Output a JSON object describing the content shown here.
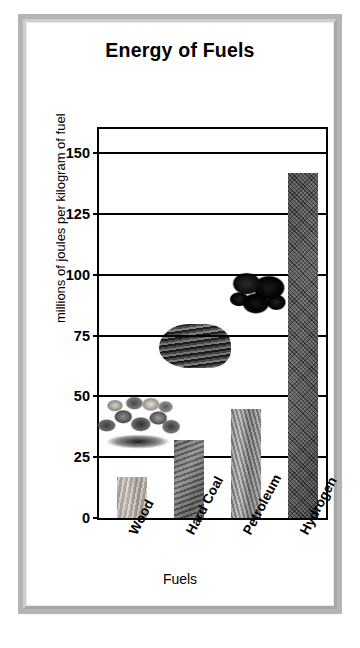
{
  "chart_data": {
    "type": "bar",
    "title": "Energy of Fuels",
    "xlabel": "Fuels",
    "ylabel": "millions of joules per kilogram of fuel",
    "categories": [
      "Wood",
      "Hard Coal",
      "Petroleum",
      "Hydrogen"
    ],
    "values": [
      17,
      32,
      45,
      142
    ],
    "ylim": [
      0,
      160
    ],
    "yticks": [
      0,
      25,
      50,
      75,
      100,
      125,
      150
    ],
    "ytick_labels": [
      "0",
      "25",
      "50",
      "75",
      "100",
      "125",
      "150"
    ],
    "grid": true,
    "legend": "none",
    "bar_textures": [
      "wood-grain",
      "hard-coal",
      "petroleum",
      "hydrogen"
    ],
    "annotations": [
      {
        "name": "wood-logs-photo",
        "near_category": "Wood"
      },
      {
        "name": "coal-rock-photo",
        "near_category": "Hard Coal"
      },
      {
        "name": "crude-oil-photo",
        "near_category": "Petroleum"
      }
    ],
    "colors": {
      "axis": "#000000",
      "background": "#ffffff",
      "frame": "#b4b4b4",
      "wood_bar": "#bdb5ab",
      "coal_bar": "#707070",
      "petroleum_bar": "#979797",
      "hydrogen_bar": "#4d4d4d"
    }
  }
}
